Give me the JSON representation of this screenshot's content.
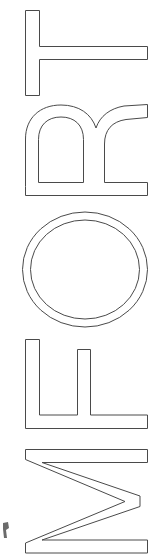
{
  "canvas": {
    "width": 156,
    "height": 555,
    "background_color": "#ffffff",
    "stroke_color": "#4a4a4a",
    "fill_color": "#ffffff",
    "stroke_width": 1
  },
  "artwork": {
    "description": "Five outlined capital letterforms stacked vertically, each rotated 90 degrees clockwise",
    "reading_direction": "bottom-to-top",
    "text_bottom_to_top": "MFORT",
    "text_top_to_bottom": "TROFM",
    "rotation_degrees": 90,
    "style": "outline",
    "letters": [
      {
        "character": "T",
        "order": 1,
        "top": 10,
        "height": 86,
        "rotated": true
      },
      {
        "character": "R",
        "order": 2,
        "top": 104,
        "height": 92,
        "rotated": true
      },
      {
        "character": "O",
        "order": 3,
        "top": 211,
        "height": 117,
        "rotated": true
      },
      {
        "character": "F",
        "order": 4,
        "top": 339,
        "height": 90,
        "rotated": true
      },
      {
        "character": "M",
        "order": 5,
        "top": 449,
        "height": 104,
        "rotated": true
      }
    ],
    "fragment": {
      "description": "partial cropped glyph mark at lower-left edge",
      "x": 2,
      "y": 522,
      "width": 8,
      "height": 16
    }
  }
}
